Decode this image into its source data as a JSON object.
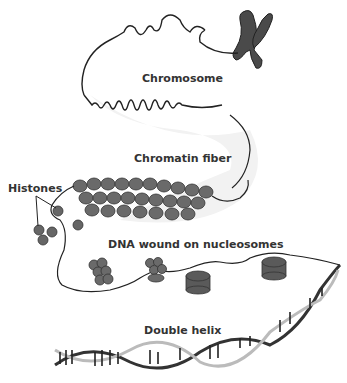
{
  "diagram": {
    "type": "dna-packaging-levels",
    "labels": {
      "chromosome": "Chromosome",
      "chromatin_fiber": "Chromatin fiber",
      "histones": "Histones",
      "nucleosomes": "DNA wound on nucleosomes",
      "double_helix": "Double helix"
    },
    "colors": {
      "ink": "#222222",
      "fill": "#555555",
      "shade": "#eeeeee",
      "text": "#333333"
    }
  }
}
